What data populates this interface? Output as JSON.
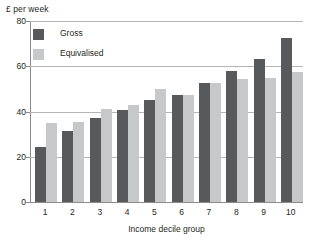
{
  "chart_data": {
    "type": "bar",
    "title": "",
    "xlabel": "Income decile group",
    "ylabel": "£ per week",
    "categories": [
      "1",
      "2",
      "3",
      "4",
      "5",
      "6",
      "7",
      "8",
      "9",
      "10"
    ],
    "series": [
      {
        "name": "Gross",
        "color": "#58595b",
        "values": [
          24.5,
          31.5,
          37.0,
          40.5,
          45.0,
          47.5,
          52.5,
          58.0,
          63.0,
          72.5
        ]
      },
      {
        "name": "Equivalised",
        "color": "#c7c8ca",
        "values": [
          35.0,
          35.5,
          41.0,
          43.0,
          50.0,
          47.5,
          52.5,
          54.5,
          55.0,
          57.5
        ]
      }
    ],
    "ylim": [
      0,
      80
    ],
    "yticks": [
      0,
      20,
      40,
      60,
      80
    ],
    "ytick_labels": [
      "0",
      "20",
      "40",
      "60",
      "80"
    ],
    "grid": true,
    "legend_position": "top-left"
  }
}
